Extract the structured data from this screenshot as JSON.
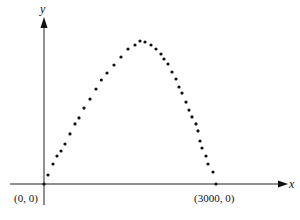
{
  "chart_data": {
    "type": "scatter",
    "title": "",
    "xlabel": "x",
    "ylabel": "y",
    "grid": false,
    "legend": null,
    "annotations": [
      "(0, 0)",
      "(3000, 0)"
    ],
    "xlim": [
      0,
      3000
    ],
    "points": [
      {
        "x": 0,
        "y": 0.0
      },
      {
        "x": 70,
        "y": 0.063
      },
      {
        "x": 157,
        "y": 0.14
      },
      {
        "x": 227,
        "y": 0.196
      },
      {
        "x": 297,
        "y": 0.231
      },
      {
        "x": 366,
        "y": 0.28
      },
      {
        "x": 453,
        "y": 0.35
      },
      {
        "x": 541,
        "y": 0.42
      },
      {
        "x": 610,
        "y": 0.462
      },
      {
        "x": 698,
        "y": 0.531
      },
      {
        "x": 802,
        "y": 0.594
      },
      {
        "x": 907,
        "y": 0.664
      },
      {
        "x": 1000,
        "y": 0.727
      },
      {
        "x": 1099,
        "y": 0.776
      },
      {
        "x": 1221,
        "y": 0.832
      },
      {
        "x": 1343,
        "y": 0.888
      },
      {
        "x": 1465,
        "y": 0.944
      },
      {
        "x": 1587,
        "y": 0.972
      },
      {
        "x": 1674,
        "y": 1.0
      },
      {
        "x": 1762,
        "y": 0.993
      },
      {
        "x": 1866,
        "y": 0.972
      },
      {
        "x": 1953,
        "y": 0.944
      },
      {
        "x": 2040,
        "y": 0.909
      },
      {
        "x": 2093,
        "y": 0.874
      },
      {
        "x": 2163,
        "y": 0.839
      },
      {
        "x": 2233,
        "y": 0.783
      },
      {
        "x": 2302,
        "y": 0.734
      },
      {
        "x": 2355,
        "y": 0.678
      },
      {
        "x": 2407,
        "y": 0.636
      },
      {
        "x": 2477,
        "y": 0.573
      },
      {
        "x": 2529,
        "y": 0.517
      },
      {
        "x": 2581,
        "y": 0.469
      },
      {
        "x": 2651,
        "y": 0.42
      },
      {
        "x": 2686,
        "y": 0.371
      },
      {
        "x": 2721,
        "y": 0.301
      },
      {
        "x": 2756,
        "y": 0.252
      },
      {
        "x": 2826,
        "y": 0.196
      },
      {
        "x": 2861,
        "y": 0.14
      },
      {
        "x": 2948,
        "y": 0.084
      },
      {
        "x": 3000,
        "y": 0.0
      }
    ]
  },
  "labels": {
    "origin": "(0, 0)",
    "end": "(3000, 0)",
    "x_axis": "x",
    "y_axis": "y"
  },
  "layout": {
    "origin_px": [
      44,
      184
    ],
    "x_scale_px_per_unit": 0.05733,
    "y_peak_px": 143
  }
}
